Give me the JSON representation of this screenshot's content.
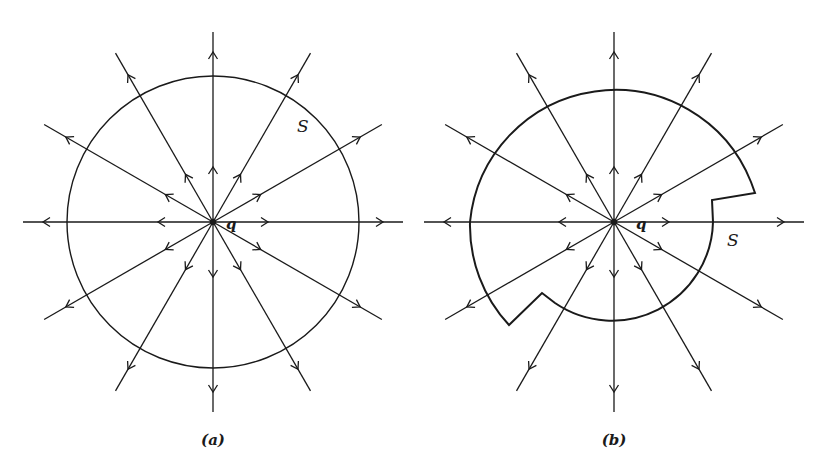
{
  "figure": {
    "panels": [
      {
        "id": "a",
        "caption": "(a)",
        "charge_label": "q",
        "surface_label": "S",
        "surface_shape": "sphere",
        "center": [
          213,
          222
        ],
        "field_line_count": 12
      },
      {
        "id": "b",
        "caption": "(b)",
        "charge_label": "q",
        "surface_label": "S",
        "surface_shape": "irregular closed surface with notches",
        "center": [
          614,
          222
        ],
        "field_line_count": 12
      }
    ],
    "colors": {
      "ink": "#1a1a1a",
      "background": "#ffffff"
    }
  }
}
